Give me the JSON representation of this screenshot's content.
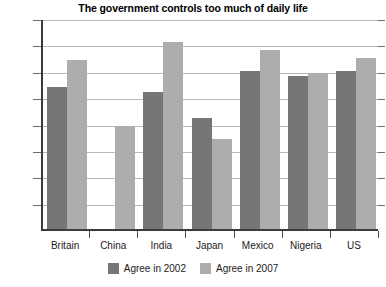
{
  "chart_data": {
    "type": "bar",
    "title": "The government controls too much of daily life",
    "xlabel": "",
    "ylabel": "",
    "ylim": [
      0,
      80
    ],
    "yticks": [
      0,
      10,
      20,
      30,
      40,
      50,
      60,
      70,
      80
    ],
    "grid": true,
    "legend_position": "bottom-center",
    "categories": [
      "Britain",
      "China",
      "India",
      "Japan",
      "Mexico",
      "Nigeria",
      "US"
    ],
    "series": [
      {
        "name": "Agree in 2002",
        "color": "#767676",
        "values": [
          54,
          null,
          52,
          42,
          60,
          58,
          60
        ]
      },
      {
        "name": "Agree in 2007",
        "color": "#adadad",
        "values": [
          64,
          39,
          71,
          34,
          68,
          59,
          65
        ]
      }
    ]
  },
  "axis": {
    "tick_labels": [
      "80",
      "70",
      "60",
      "50",
      "40",
      "30",
      "20",
      "10",
      "0"
    ]
  },
  "legend": {
    "items": [
      {
        "label": "Agree in 2002",
        "color": "#767676"
      },
      {
        "label": "Agree in 2007",
        "color": "#adadad"
      }
    ]
  },
  "colors": {
    "axis": "#3b3b3b",
    "gridline": "#b8b8b8",
    "text": "#1a1a1a",
    "background": "#ffffff"
  }
}
